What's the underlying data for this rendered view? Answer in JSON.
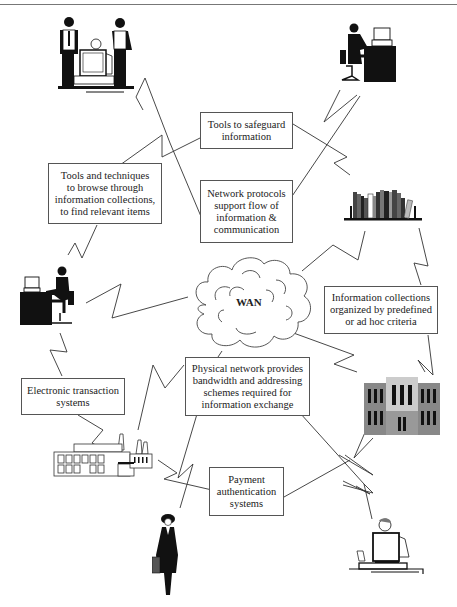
{
  "diagram": {
    "type": "network-concept-diagram",
    "center_node": {
      "label": "WAN",
      "icon": "cloud-icon"
    },
    "boxes": {
      "safeguard": {
        "lines": [
          "Tools to safeguard",
          "information"
        ]
      },
      "protocols": {
        "lines": [
          "Network protocols",
          "support flow of",
          "information &",
          "communication"
        ]
      },
      "browse": {
        "lines": [
          "Tools and techniques",
          "to browse through",
          "information collections,",
          "to find relevant items"
        ]
      },
      "collections": {
        "lines": [
          "Information collections",
          "organized by predefined",
          "or ad hoc criteria"
        ]
      },
      "physical": {
        "lines": [
          "Physical network provides",
          "bandwidth and addressing",
          "schemes required for",
          "information exchange"
        ]
      },
      "transaction": {
        "lines": [
          "Electronic transaction",
          "systems"
        ]
      },
      "payment": {
        "lines": [
          "Payment",
          "authentication",
          "systems"
        ]
      }
    },
    "nodes": [
      {
        "id": "team",
        "icon": "team-at-computer-icon"
      },
      {
        "id": "desk-user-top",
        "icon": "person-at-desk-icon"
      },
      {
        "id": "books",
        "icon": "bookshelf-icon"
      },
      {
        "id": "desk-user-left",
        "icon": "person-at-desk-icon"
      },
      {
        "id": "library",
        "icon": "library-building-icon"
      },
      {
        "id": "factory",
        "icon": "factory-icon"
      },
      {
        "id": "walker",
        "icon": "businesswoman-icon"
      },
      {
        "id": "laptop-user",
        "icon": "person-at-laptop-icon"
      }
    ]
  }
}
